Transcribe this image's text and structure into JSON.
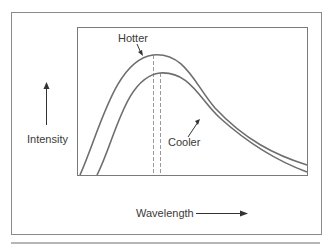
{
  "figure": {
    "labels": {
      "hotter": "Hotter",
      "cooler": "Cooler",
      "y_axis": "Intensity",
      "x_axis": "Wavelength"
    },
    "curves": [
      {
        "name": "Hotter",
        "peak_x": 153,
        "peak_y": 55
      },
      {
        "name": "Cooler",
        "peak_x": 160,
        "peak_y": 73
      }
    ],
    "colors": {
      "curve": "#6e6e6e",
      "frame": "#8a8a8a",
      "text": "#3a3a3a",
      "dashed": "#9a9a9a"
    }
  }
}
